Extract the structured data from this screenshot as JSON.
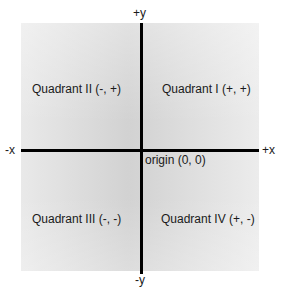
{
  "diagram": {
    "axes": {
      "pos_y": "+y",
      "neg_y": "-y",
      "pos_x": "+x",
      "neg_x": "-x"
    },
    "origin_label": "origin (0, 0)",
    "quadrants": [
      {
        "id": "I",
        "label": "Quadrant I (+, +)"
      },
      {
        "id": "II",
        "label": "Quadrant II (-, +)"
      },
      {
        "id": "III",
        "label": "Quadrant III (-, -)"
      },
      {
        "id": "IV",
        "label": "Quadrant IV (+, -)"
      }
    ],
    "colors": {
      "plane_fill": "#d8d8d8",
      "axis_line": "#000000",
      "text": "#1a1a1a"
    }
  }
}
